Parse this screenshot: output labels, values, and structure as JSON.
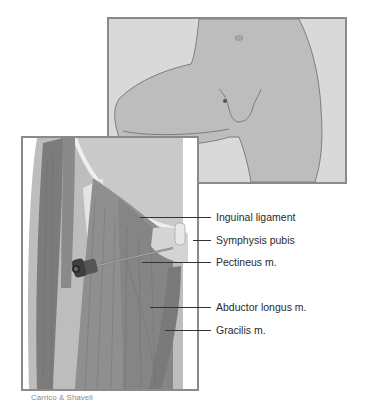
{
  "figure": {
    "type": "anatomical-illustration",
    "panels": [
      {
        "id": "surface-view",
        "description": "Surface view of lower torso and thigh with injection point marker"
      },
      {
        "id": "anatomy-view",
        "description": "Deep muscle view of medial thigh with needle"
      }
    ]
  },
  "labels": [
    {
      "id": "inguinal-ligament",
      "text": "Inguinal ligament"
    },
    {
      "id": "symphysis-pubis",
      "text": "Symphysis pubis"
    },
    {
      "id": "pectineus",
      "text": "Pectineus m."
    },
    {
      "id": "abductor-longus",
      "text": "Abductor longus m."
    },
    {
      "id": "gracilis",
      "text": "Gracilis m."
    }
  ],
  "credit": "Carrico & Shavell",
  "colors": {
    "skin": "#bdbdbd",
    "background": "#d9d9d9",
    "muscle": "#8c8c8c",
    "muscle_dark": "#6e6e6e",
    "tendon": "#e6e6e6",
    "border": "#8a8a8a"
  }
}
